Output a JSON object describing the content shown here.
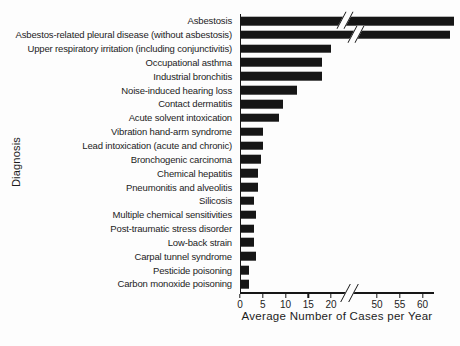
{
  "figure": {
    "x_axis_title": "Average Number of Cases per Year",
    "y_axis_title": "Diagnosis"
  },
  "chart_data": {
    "type": "bar",
    "orientation": "horizontal",
    "title": "",
    "xlabel": "Average Number of Cases per Year",
    "ylabel": "Diagnosis",
    "categories": [
      "Asbestosis",
      "Asbestos-related pleural disease (without asbestosis)",
      "Upper respiratory irritation (including conjunctivitis)",
      "Occupational asthma",
      "Industrial bronchitis",
      "Noise-induced hearing loss",
      "Contact dermatitis",
      "Acute solvent intoxication",
      "Vibration hand-arm syndrome",
      "Lead intoxication (acute and chronic)",
      "Bronchogenic carcinoma",
      "Chemical hepatitis",
      "Pneumonitis and alveolitis",
      "Silicosis",
      "Multiple chemical sensitivities",
      "Post-traumatic stress disorder",
      "Low-back strain",
      "Carpal tunnel syndrome",
      "Pesticide poisoning",
      "Carbon monoxide poisoning"
    ],
    "values": [
      67,
      66,
      20,
      18,
      18,
      12.5,
      9.5,
      8.5,
      5,
      5,
      4.5,
      4,
      4,
      3,
      3.5,
      3,
      3,
      3.5,
      2,
      2
    ],
    "axis": {
      "ticks": [
        0,
        5,
        10,
        15,
        20,
        50,
        55,
        60
      ],
      "break_between": [
        22,
        48
      ],
      "xlim": [
        0,
        62
      ],
      "grid": false
    },
    "bars_with_axis_break": [
      "Asbestosis",
      "Asbestos-related pleural disease (without asbestosis)"
    ],
    "bar_color": "#161616",
    "background_color": "#fdfdfd",
    "legend": null
  }
}
